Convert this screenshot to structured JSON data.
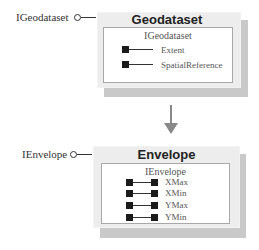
{
  "diagram": {
    "classes": [
      {
        "name": "Geodataset",
        "interface_label": "IGeodataset",
        "inner_interface": "IGeodataset",
        "properties": [
          {
            "name": "Extent",
            "access": "read"
          },
          {
            "name": "SpatialReference",
            "access": "read"
          }
        ]
      },
      {
        "name": "Envelope",
        "interface_label": "IEnvelope",
        "inner_interface": "IEnvelope",
        "properties": [
          {
            "name": "XMax",
            "access": "read-write"
          },
          {
            "name": "XMin",
            "access": "read-write"
          },
          {
            "name": "YMax",
            "access": "read-write"
          },
          {
            "name": "YMin",
            "access": "read-write"
          }
        ]
      }
    ],
    "relationship": {
      "from": "Geodataset",
      "to": "Envelope",
      "type": "arrow-down"
    },
    "colors": {
      "box_fill": "#ededed",
      "shadow": "#c9c9c9",
      "inner_border": "#a8a8a8",
      "arrow": "#888888",
      "property_marker": "#1a1a1a"
    }
  }
}
